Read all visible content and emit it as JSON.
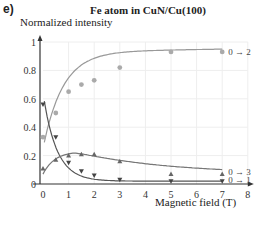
{
  "panel": {
    "label": "e)"
  },
  "chart_data": {
    "type": "line",
    "title": "Fe atom in CuN/Cu(100)",
    "xlabel": "Magnetic field (T)",
    "ylabel": "Normalized intensity",
    "xlim": [
      0,
      8
    ],
    "ylim": [
      0,
      1
    ],
    "xticks": [
      0,
      1,
      2,
      3,
      4,
      5,
      6,
      7,
      8
    ],
    "yticks": [
      0,
      0.2,
      0.4,
      0.6,
      0.8,
      1
    ],
    "ytick_labels": [
      "0",
      "0.2",
      "0.4",
      "0.6",
      "0.8",
      "1"
    ],
    "grid": true,
    "x": [
      0,
      0.5,
      1,
      1.5,
      2,
      3,
      5,
      7
    ],
    "series": [
      {
        "name": "0 → 2",
        "marker": "circle",
        "color": "#999999",
        "values": [
          0.33,
          0.5,
          0.65,
          0.7,
          0.73,
          0.82,
          0.93,
          0.93
        ]
      },
      {
        "name": "0 → 1",
        "marker": "triangle-down",
        "color": "#555555",
        "values": [
          0.56,
          0.33,
          0.15,
          0.09,
          0.06,
          0.03,
          0.02,
          0.02
        ]
      },
      {
        "name": "0 → 3",
        "marker": "triangle-up",
        "color": "#777777",
        "values": [
          0.11,
          0.17,
          0.2,
          0.21,
          0.21,
          0.16,
          0.07,
          0.07
        ]
      }
    ]
  }
}
